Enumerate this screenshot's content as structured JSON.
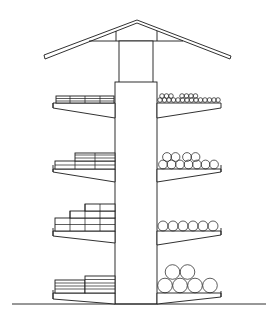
{
  "diagram": {
    "type": "technical-elevation",
    "subject": "Central-column storage tower with cantilevered shelves and gabled roof",
    "structure": {
      "roof": "gable roof with tie beam",
      "column": "central vertical column",
      "levels": 4,
      "ground_line": true
    },
    "levels": [
      {
        "level": 1,
        "left_load": "stacked boards (2 layers, 4 bundles)",
        "right_load": "small logs/pipes (2 rows)"
      },
      {
        "level": 2,
        "left_load": "stacked boards (stepped, 2-3 layers)",
        "right_load": "medium logs (2 rows)"
      },
      {
        "level": 3,
        "left_load": "stacked blocks (stepped, 2-4 layers)",
        "right_load": "medium logs (1 row of 6)"
      },
      {
        "level": 4,
        "left_load": "stacked planks (2 bundles)",
        "right_load": "large logs (2 rows, 4+2)"
      }
    ],
    "colors": {
      "line": "#1a1a1a",
      "background": "#ffffff"
    }
  }
}
